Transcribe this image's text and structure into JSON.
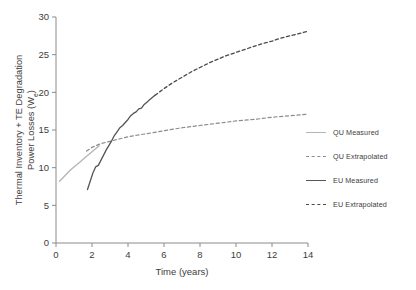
{
  "chart_data": {
    "type": "line",
    "title": "",
    "xlabel": "Time (years)",
    "ylabel": "Thermal Inventory + TE Degradation Power Losses (We)",
    "ylabel_line1": "Thermal Inventory + TE Degradation",
    "ylabel_line2_prefix": "Power Losses (W",
    "ylabel_line2_sub": "e",
    "ylabel_line2_suffix": ")",
    "xlim": [
      0,
      14
    ],
    "ylim": [
      0,
      30
    ],
    "xticks": [
      0,
      2,
      4,
      6,
      8,
      10,
      12,
      14
    ],
    "yticks": [
      0,
      5,
      10,
      15,
      20,
      25,
      30
    ],
    "xtick_labels": [
      "0",
      "2",
      "4",
      "6",
      "8",
      "10",
      "12",
      "14"
    ],
    "ytick_labels": [
      "0",
      "5",
      "10",
      "15",
      "20",
      "25",
      "30"
    ],
    "grid": false,
    "legend_position": "right",
    "series": [
      {
        "name": "QU Measured",
        "style": "solid",
        "color": "#b4b4b4",
        "width": 1.3,
        "x": [
          0.2,
          0.4,
          0.6,
          0.8,
          1.0,
          1.2,
          1.4,
          1.6,
          1.8,
          2.0,
          2.2,
          2.4
        ],
        "y": [
          8.2,
          8.7,
          9.2,
          9.7,
          10.1,
          10.5,
          10.9,
          11.3,
          11.7,
          12.1,
          12.5,
          12.9
        ]
      },
      {
        "name": "QU Extrapolated",
        "style": "dashed",
        "color": "#8c8c8c",
        "width": 1.2,
        "x": [
          1.7,
          2.0,
          2.5,
          3.0,
          3.5,
          4.0,
          4.5,
          5.0,
          6.0,
          7.0,
          8.0,
          9.0,
          10.0,
          11.0,
          12.0,
          13.0,
          14.0
        ],
        "y": [
          12.2,
          12.7,
          13.2,
          13.5,
          13.8,
          14.1,
          14.3,
          14.5,
          14.9,
          15.3,
          15.6,
          15.9,
          16.2,
          16.4,
          16.7,
          16.9,
          17.1
        ]
      },
      {
        "name": "EU Measured",
        "style": "solid",
        "color": "#555555",
        "width": 1.3,
        "x": [
          1.75,
          1.9,
          2.05,
          2.2,
          2.35,
          2.5,
          2.65,
          2.8,
          2.95,
          3.1,
          3.25,
          3.4,
          3.55,
          3.7,
          3.85,
          4.0,
          4.15,
          4.3,
          4.45,
          4.6,
          4.75,
          4.9,
          5.05,
          5.2,
          5.35,
          5.5
        ],
        "y": [
          7.1,
          8.2,
          9.3,
          10.1,
          10.3,
          11.0,
          11.7,
          12.4,
          13.0,
          13.6,
          14.3,
          14.8,
          15.3,
          15.6,
          16.0,
          16.4,
          16.9,
          17.2,
          17.4,
          17.8,
          17.9,
          18.4,
          18.7,
          19.0,
          19.3,
          19.6
        ]
      },
      {
        "name": "EU Extrapolated",
        "style": "dashed",
        "color": "#4a4a4a",
        "width": 1.3,
        "x": [
          5.5,
          6.0,
          6.5,
          7.0,
          7.5,
          8.0,
          8.5,
          9.0,
          9.5,
          10.0,
          10.5,
          11.0,
          11.5,
          12.0,
          12.5,
          13.0,
          13.5,
          14.0
        ],
        "y": [
          19.6,
          20.5,
          21.3,
          22.0,
          22.7,
          23.3,
          23.9,
          24.4,
          24.9,
          25.3,
          25.7,
          26.1,
          26.5,
          26.8,
          27.2,
          27.5,
          27.8,
          28.1
        ]
      }
    ]
  },
  "legend": {
    "items": [
      {
        "label": "QU Measured",
        "color": "#b4b4b4",
        "style": "solid"
      },
      {
        "label": "QU Extrapolated",
        "color": "#8c8c8c",
        "style": "dashed"
      },
      {
        "label": "EU Measured",
        "color": "#555555",
        "style": "solid"
      },
      {
        "label": "EU Extrapolated",
        "color": "#4a4a4a",
        "style": "dashed"
      }
    ]
  },
  "axis_color": "#8a8a8a",
  "text_color": "#3d3d3d"
}
